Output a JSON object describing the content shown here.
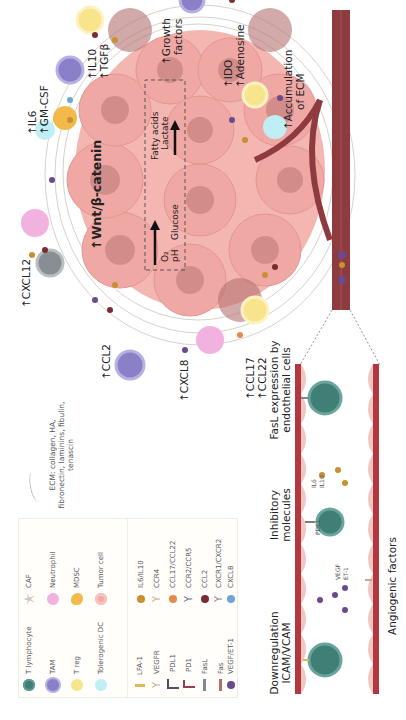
{
  "diagram": {
    "orientation": "rotated-90-ccw",
    "legend": {
      "cells": [
        {
          "label": "T lymphocyte",
          "icon": "t-lymphocyte-icon",
          "color": "#3f7f75"
        },
        {
          "label": "TAM",
          "icon": "tam-icon",
          "color": "#8a80c8"
        },
        {
          "label": "T reg",
          "icon": "treg-icon",
          "color": "#f8e48c"
        },
        {
          "label": "Tolerogenic DC",
          "icon": "tolerogenic-dc-icon",
          "color": "#bfeef5"
        },
        {
          "label": "CAF",
          "icon": "caf-icon",
          "color": "#d3c7bd"
        },
        {
          "label": "Neutrophil",
          "icon": "neutrophil-icon",
          "color": "#f1b2e0"
        },
        {
          "label": "MDSC",
          "icon": "mdsc-icon",
          "color": "#f3b94a"
        },
        {
          "label": "Tumor cell",
          "icon": "tumor-cell-icon",
          "color": "#f2a9a6"
        }
      ],
      "molecules": [
        {
          "label": "LFA-1",
          "icon": "lfa1-receptor-icon",
          "color": "#e0b65a"
        },
        {
          "label": "VEGFR",
          "icon": "vegfr-receptor-icon",
          "color": "#c9a98a"
        },
        {
          "label": "PDL1",
          "icon": "pdl1-icon",
          "color": "#5b4a5e"
        },
        {
          "label": "PD1",
          "icon": "pd1-icon",
          "color": "#a03a4e"
        },
        {
          "label": "FasL",
          "icon": "fasl-icon",
          "color": "#7d8a8e"
        },
        {
          "label": "Fas",
          "icon": "fas-icon",
          "color": "#b96a6a"
        },
        {
          "label": "VEGF/ET-1",
          "icon": "vegf-et1-dot-icon",
          "color": "#6a4a8e"
        },
        {
          "label": "IL6/IL10",
          "icon": "il6-il10-dot-icon",
          "color": "#c8902e"
        },
        {
          "label": "CCR4",
          "icon": "ccr4-receptor-icon",
          "color": "#c9b07a"
        },
        {
          "label": "CCL17/CCL22",
          "icon": "ccl17-ccl22-dot-icon",
          "color": "#e48a4a"
        },
        {
          "label": "CCR2/CCR5",
          "icon": "ccr2-ccr5-receptor-icon",
          "color": "#6a6d8a"
        },
        {
          "label": "CCL2",
          "icon": "ccl2-dot-icon",
          "color": "#7a2c32"
        },
        {
          "label": "CXCR1/CXCR2",
          "icon": "cxcr1-cxcr2-receptor-icon",
          "color": "#9a7aa8"
        },
        {
          "label": "CXCL8",
          "icon": "cxcl8-dot-icon",
          "color": "#6fa6d8"
        }
      ],
      "ecm_note": "ECM: collagen, HA, fibronectin, laminins, fibulin, tenascin"
    },
    "tumor_labels": {
      "cxcl12": "↑CXCL12",
      "il6_gmcsf": [
        "↑IL6",
        "↑GM-CSF"
      ],
      "il10_tgfb": [
        "↑IL10",
        "↑TGFβ"
      ],
      "growth_factors": [
        "↑Growth",
        "factors"
      ],
      "ido_adenosine": [
        "↑IDO",
        "↑Adenosine"
      ],
      "ecm_accumulation": [
        "↑Accumulation",
        "of ECM"
      ],
      "ccl2": "↑CCL2",
      "cxcl8": "↑CXCL8",
      "ccl17_ccl22": [
        "↑CCL17",
        "↑CCL22"
      ],
      "wnt": "↑Wnt/β-catenin",
      "metabolism_in": [
        "O₂",
        "pH",
        "Glucose"
      ],
      "metabolism_out": [
        "Fatty acids",
        "Lactate"
      ]
    },
    "vessel_panel": {
      "sections": [
        {
          "title": [
            "Downregulation",
            "ICAM/VCAM"
          ]
        },
        {
          "title": [
            "Inhibitory",
            "molecules"
          ],
          "small": [
            "PDL1"
          ],
          "cytokines": [
            "IL6",
            "IL10"
          ]
        },
        {
          "title": [
            "FasL expression by",
            "endothelial cells"
          ]
        }
      ],
      "angio_small": [
        "VEGF",
        "ET-1"
      ],
      "bottom_label": "Angiogenic factors"
    },
    "colors": {
      "vessel": "#8e3b40",
      "vessel_wall": "#f2c6c0",
      "tumor": "#f0a8a4",
      "tumor_dark": "#c98583",
      "t_cell": "#3f7f75"
    }
  }
}
